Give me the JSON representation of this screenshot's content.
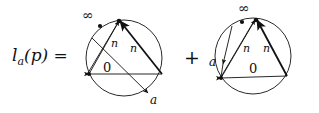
{
  "figure": {
    "equation_label": "l",
    "equation_subscript": "a",
    "equation_rest": "(p) =",
    "operator": "+",
    "background_color": "#ffffff",
    "stroke_color": "#111111"
  },
  "diagram_1": {
    "name": "inscribed-triangle-circle-left",
    "vertex_labels": {
      "infinity": "∞",
      "edge_left": "n",
      "edge_right": "n",
      "center": "0",
      "point_a": "a"
    }
  },
  "diagram_2": {
    "name": "inscribed-triangle-circle-right",
    "vertex_labels": {
      "infinity": "∞",
      "edge_left": "n",
      "edge_right": "n",
      "center": "0",
      "point_a": "a"
    }
  }
}
